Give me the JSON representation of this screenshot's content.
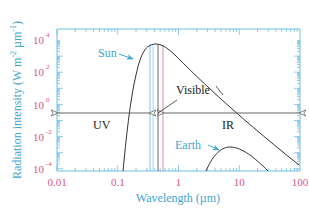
{
  "chart_data": {
    "type": "line",
    "title": "",
    "xlabel": "Wavelength (µm)",
    "ylabel": "Radiation intensity (W m⁻² µm⁻¹)",
    "xscale": "log",
    "yscale": "log",
    "xlim": [
      0.01,
      100
    ],
    "ylim": [
      0.0001,
      10000
    ],
    "x_ticks": [
      "0.01",
      "0.1",
      "1",
      "10",
      "100"
    ],
    "y_ticks": [
      "10^4",
      "10^2",
      "10^0",
      "10^-2",
      "10^-4"
    ],
    "grid": false,
    "series": [
      {
        "name": "Sun",
        "x": [
          0.08,
          0.1,
          0.15,
          0.2,
          0.3,
          0.5,
          0.7,
          1,
          2,
          5,
          10,
          20,
          50,
          100
        ],
        "y": [
          0.0001,
          0.05,
          3,
          60,
          1000,
          5000,
          4000,
          1500,
          150,
          5,
          0.4,
          0.03,
          0.001,
          0.0002
        ]
      },
      {
        "name": "Earth",
        "x": [
          3.5,
          5,
          7,
          10,
          15,
          20,
          30,
          50
        ],
        "y": [
          0.0001,
          0.0006,
          0.001,
          0.0012,
          0.0009,
          0.0006,
          0.0003,
          0.0001
        ]
      }
    ],
    "annotations": [
      {
        "text": "Sun",
        "color": "#3ea6cf"
      },
      {
        "text": "Earth",
        "color": "#3ea6cf"
      },
      {
        "text": "Visible",
        "range_um": [
          0.4,
          0.7
        ]
      },
      {
        "text": "UV",
        "range_um": [
          0.01,
          0.4
        ]
      },
      {
        "text": "IR",
        "range_um": [
          0.7,
          100
        ]
      }
    ]
  },
  "labels": {
    "xlabel": "Wavelength (µm)",
    "ylabel": "Radiation intensity (W m",
    "ylabel_sup1": "-2",
    "ylabel_mid": " µm",
    "ylabel_sup2": "-1",
    "ylabel_end": ")",
    "x_ticks": [
      "0.01",
      "0.1",
      "1",
      "10",
      "100"
    ],
    "y_ticks": [
      {
        "base": "10",
        "exp": "4"
      },
      {
        "base": "10",
        "exp": "2"
      },
      {
        "base": "10",
        "exp": "0"
      },
      {
        "base": "10",
        "exp": "-2"
      },
      {
        "base": "10",
        "exp": "-4"
      }
    ],
    "sun": "Sun",
    "earth": "Earth",
    "visible": "Visible",
    "uv": "UV",
    "ir": "IR"
  },
  "colors": {
    "axis": "#6fc0e0",
    "tick_label": "#d6577f",
    "axis_label": "#3ea6cf",
    "curve": "#333333",
    "visible_blue": "#7ec4e4",
    "visible_lightblue": "#a8d8ee",
    "visible_dark": "#555555",
    "visible_pink": "#e08aa6"
  }
}
